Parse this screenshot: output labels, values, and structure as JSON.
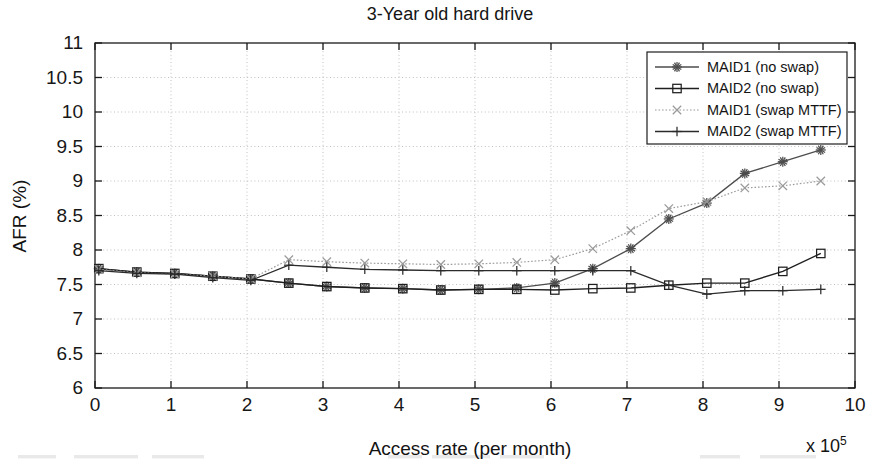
{
  "chart_data": {
    "type": "line",
    "title": "3-Year old hard drive",
    "xlabel": "Access rate (per month)",
    "ylabel": "AFR (%)",
    "x_multiplier": "x 10",
    "x_multiplier_exponent": "5",
    "xlim": [
      0,
      10
    ],
    "ylim": [
      6,
      11
    ],
    "xticks": [
      0,
      1,
      2,
      3,
      4,
      5,
      6,
      7,
      8,
      9,
      10
    ],
    "yticks": [
      6,
      6.5,
      7,
      7.5,
      8,
      8.5,
      9,
      9.5,
      10,
      10.5,
      11
    ],
    "xtick_labels": [
      "0",
      "1",
      "2",
      "3",
      "4",
      "5",
      "6",
      "7",
      "8",
      "9",
      "10"
    ],
    "ytick_labels": [
      "6",
      "6.5",
      "7",
      "7.5",
      "8",
      "8.5",
      "9",
      "9.5",
      "10",
      "10.5",
      "11"
    ],
    "grid": true,
    "legend_position": "top-right",
    "x": [
      0.05,
      0.55,
      1.05,
      1.55,
      2.05,
      2.55,
      3.05,
      3.55,
      4.05,
      4.55,
      5.05,
      5.55,
      6.05,
      6.55,
      7.05,
      7.55,
      8.05,
      8.55,
      9.05,
      9.55
    ],
    "series": [
      {
        "name": "MAID1 (no swap)",
        "marker": "asterisk-marker",
        "color": "#4d4d4d",
        "line_width": 1.3,
        "dash": "none",
        "values": [
          7.73,
          7.68,
          7.66,
          7.62,
          7.58,
          7.52,
          7.47,
          7.45,
          7.44,
          7.42,
          7.43,
          7.45,
          7.52,
          7.73,
          8.02,
          8.45,
          8.68,
          9.11,
          9.28,
          9.45
        ]
      },
      {
        "name": "MAID2 (no swap)",
        "marker": "square-marker",
        "color": "#1f1f1f",
        "line_width": 1.4,
        "dash": "none",
        "values": [
          7.73,
          7.68,
          7.66,
          7.62,
          7.58,
          7.52,
          7.47,
          7.45,
          7.44,
          7.42,
          7.43,
          7.43,
          7.42,
          7.44,
          7.45,
          7.49,
          7.52,
          7.52,
          7.69,
          7.95
        ]
      },
      {
        "name": "MAID1 (swap MTTF)",
        "marker": "x-marker",
        "color": "#9a9a9a",
        "line_width": 1.2,
        "dash": "1.6,1.9",
        "values": [
          7.72,
          7.67,
          7.65,
          7.62,
          7.58,
          7.86,
          7.83,
          7.81,
          7.8,
          7.79,
          7.8,
          7.82,
          7.86,
          8.02,
          8.28,
          8.6,
          8.7,
          8.9,
          8.93,
          9.0
        ]
      },
      {
        "name": "MAID2 (swap MTTF)",
        "marker": "plus-marker",
        "color": "#2b2b2b",
        "line_width": 1.3,
        "dash": "none",
        "values": [
          7.7,
          7.66,
          7.65,
          7.6,
          7.56,
          7.78,
          7.75,
          7.72,
          7.71,
          7.7,
          7.7,
          7.7,
          7.7,
          7.7,
          7.7,
          7.49,
          7.36,
          7.41,
          7.41,
          7.43
        ]
      }
    ]
  }
}
